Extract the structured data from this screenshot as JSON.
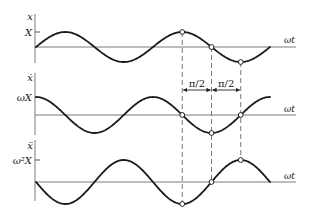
{
  "diagram": {
    "type": "phase-relationship",
    "origin_x": 36,
    "period_px": 117,
    "periods": 2,
    "axis_end_x": 296,
    "panels": [
      {
        "id": "displacement",
        "y_label": "x",
        "amplitude_label": "X",
        "axis_label": "ωt",
        "function": "sin",
        "axis_y": 47,
        "amplitude_px": 15,
        "vaxis": [
          14,
          63
        ],
        "show_tick": true
      },
      {
        "id": "velocity",
        "y_label": "ẋ",
        "amplitude_label": "ωX",
        "axis_label": "ωt",
        "function": "cos",
        "axis_y": 115,
        "amplitude_px": 18,
        "vaxis": [
          73,
          135
        ],
        "show_tick": false
      },
      {
        "id": "acceleration",
        "y_label": "ẍ",
        "amplitude_label": "ω²X",
        "axis_label": "ωt",
        "function": "-sin",
        "axis_y": 182,
        "amplitude_px": 22,
        "vaxis": [
          140,
          201
        ],
        "show_tick": true
      }
    ],
    "guide_quarters": [
      5,
      6,
      7
    ],
    "phase_annotations": [
      {
        "label": "π/2",
        "from_quarter": 5,
        "to_quarter": 6
      },
      {
        "label": "π/2",
        "from_quarter": 6,
        "to_quarter": 7
      }
    ],
    "colors": {
      "curve": "#1a1a1a",
      "axis": "#7a7a7a",
      "guide": "#777777",
      "marker_fill": "#ffffff"
    }
  }
}
